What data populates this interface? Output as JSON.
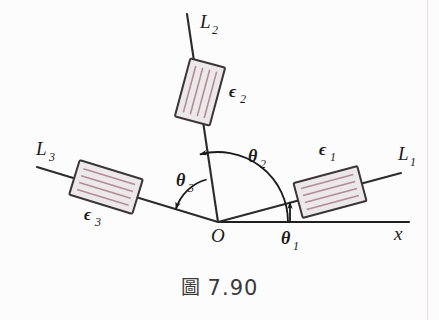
{
  "figure": {
    "caption_glyph": "圖",
    "caption_number": "7.90",
    "origin_label": "O",
    "axis_label": "x"
  },
  "lines": [
    {
      "id": "L1",
      "label": "L",
      "subscript": "1",
      "angle_deg": 15,
      "label_x": 398,
      "label_y": 160,
      "sub_x": 410,
      "sub_y": 166,
      "x1": 218,
      "y1": 222,
      "x2": 401,
      "y2": 173
    },
    {
      "id": "L2",
      "label": "L",
      "subscript": "2",
      "angle_deg": 105,
      "label_x": 200,
      "label_y": 28,
      "sub_x": 212,
      "sub_y": 34,
      "x1": 218,
      "y1": 222,
      "x2": 187,
      "y2": 14
    },
    {
      "id": "L3",
      "label": "L",
      "subscript": "3",
      "angle_deg": 163,
      "label_x": 36,
      "label_y": 155,
      "sub_x": 49,
      "sub_y": 161,
      "x1": 218,
      "y1": 222,
      "x2": 37,
      "y2": 167
    }
  ],
  "axis": {
    "x1": 218,
    "y1": 222,
    "x2": 409,
    "y2": 222,
    "label_x": 394,
    "label_y": 240
  },
  "polarizers": [
    {
      "id": "eps1",
      "label": "ϵ",
      "subscript": "1",
      "cx": 330,
      "cy": 192,
      "w": 66,
      "h": 36,
      "rotate": -15,
      "hatch": "along",
      "hatch_count": 4,
      "label_x": 319,
      "label_y": 155,
      "sub_x": 330,
      "sub_y": 161
    },
    {
      "id": "eps2",
      "label": "ϵ",
      "subscript": "2",
      "cx": 200,
      "cy": 92,
      "w": 60,
      "h": 36,
      "rotate": -75,
      "hatch": "along",
      "hatch_count": 4,
      "label_x": 229,
      "label_y": 97,
      "sub_x": 240,
      "sub_y": 103
    },
    {
      "id": "eps3",
      "label": "ϵ",
      "subscript": "3",
      "cx": 106,
      "cy": 187,
      "w": 66,
      "h": 36,
      "rotate": 17,
      "hatch": "along",
      "hatch_count": 4,
      "label_x": 84,
      "label_y": 220,
      "sub_x": 95,
      "sub_y": 226
    }
  ],
  "angles": [
    {
      "id": "theta1",
      "label": "θ",
      "subscript": "1",
      "label_x": 281,
      "label_y": 244,
      "sub_x": 293,
      "sub_y": 250,
      "marker": "vertical-arrow",
      "ax": 290,
      "ay_bottom": 222,
      "ay_top": 202
    },
    {
      "id": "theta2",
      "label": "θ",
      "subscript": "2",
      "label_x": 248,
      "label_y": 162,
      "sub_x": 260,
      "sub_y": 168,
      "marker": "arc",
      "radius": 70,
      "from_deg": 0,
      "to_deg": 105
    },
    {
      "id": "theta3",
      "label": "θ",
      "subscript": "3",
      "label_x": 176,
      "label_y": 186,
      "sub_x": 188,
      "sub_y": 192,
      "marker": "arc",
      "radius": 44,
      "from_deg": 105,
      "to_deg": 163
    }
  ],
  "colors": {
    "ink": "#1a1a1a",
    "line": "#2b2b2b",
    "polarizer_fill": "#ece7e8",
    "polarizer_border": "#3a3638",
    "polarizer_hatch": "#b08d96",
    "page": "#fdfcfc",
    "page_edge": "#e8dede"
  },
  "chart_data": {
    "type": "diagram",
    "origin": {
      "x": 218,
      "y": 222,
      "label": "O"
    },
    "reference_axis": {
      "label": "x",
      "angle_deg": 0
    },
    "lines": [
      {
        "name": "L1",
        "angle_from_x_axis_deg": 15,
        "polarizer": "ϵ1"
      },
      {
        "name": "L2",
        "angle_from_x_axis_deg": 105,
        "polarizer": "ϵ2"
      },
      {
        "name": "L3",
        "angle_from_x_axis_deg": 163,
        "polarizer": "ϵ3"
      }
    ],
    "angle_markers": [
      {
        "name": "θ1",
        "between": [
          "x-axis",
          "L1"
        ],
        "value_deg": 15
      },
      {
        "name": "θ2",
        "between": [
          "x-axis",
          "L2"
        ],
        "value_deg": 105
      },
      {
        "name": "θ3",
        "between": [
          "L2",
          "L3"
        ],
        "value_deg": 58
      }
    ]
  }
}
